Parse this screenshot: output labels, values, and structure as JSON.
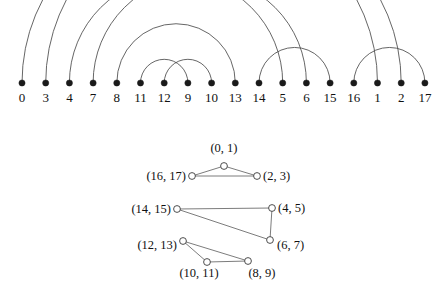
{
  "figure": {
    "title": "",
    "colors": {
      "arc_stroke": "#4a4a4a",
      "node_fill": "#1a1a1a",
      "edge_stroke": "#5a5a5a",
      "open_node_fill": "#ffffff",
      "open_node_stroke": "#3a3a3a",
      "background": "#ffffff",
      "text": "#111111"
    }
  },
  "chart_data": {
    "type": "diagram",
    "title": "",
    "xlabel": "",
    "ylabel": "",
    "subplots": [
      {
        "name": "arc-diagram",
        "type": "arc",
        "node_order": [
          "0",
          "3",
          "4",
          "7",
          "8",
          "11",
          "12",
          "9",
          "10",
          "13",
          "14",
          "5",
          "6",
          "15",
          "16",
          "1",
          "2",
          "17"
        ],
        "node_positions_x": [
          22,
          45.7,
          69.4,
          93.1,
          116.8,
          140.5,
          164.2,
          187.9,
          211.6,
          235.3,
          259,
          282.7,
          306.4,
          330.1,
          353.8,
          377.5,
          401.2,
          424.9
        ],
        "baseline_y": 83,
        "arcs": [
          {
            "from_index": 0,
            "to_index": 15,
            "from_label": "0",
            "to_label": "1"
          },
          {
            "from_index": 1,
            "to_index": 16,
            "from_label": "3",
            "to_label": "2"
          },
          {
            "from_index": 2,
            "to_index": 11,
            "from_label": "4",
            "to_label": "5"
          },
          {
            "from_index": 3,
            "to_index": 12,
            "from_label": "7",
            "to_label": "6"
          },
          {
            "from_index": 4,
            "to_index": 9,
            "from_label": "8",
            "to_label": "13"
          },
          {
            "from_index": 5,
            "to_index": 7,
            "from_label": "11",
            "to_label": "9"
          },
          {
            "from_index": 6,
            "to_index": 8,
            "from_label": "12",
            "to_label": "10"
          },
          {
            "from_index": 10,
            "to_index": 13,
            "from_label": "14",
            "to_label": "15"
          },
          {
            "from_index": 14,
            "to_index": 17,
            "from_label": "16",
            "to_label": "17"
          }
        ]
      },
      {
        "name": "pair-graph",
        "type": "graph",
        "nodes": [
          {
            "id": "0_1",
            "label": "(0, 1)",
            "x": 224,
            "y": 166,
            "label_x": 224,
            "label_y": 152,
            "label_anchor": "middle"
          },
          {
            "id": "16_17",
            "label": "(16, 17)",
            "x": 192,
            "y": 176,
            "label_x": 186,
            "label_y": 180,
            "label_anchor": "end"
          },
          {
            "id": "2_3",
            "label": "(2, 3)",
            "x": 257,
            "y": 176,
            "label_x": 263,
            "label_y": 180,
            "label_anchor": "start"
          },
          {
            "id": "14_15",
            "label": "(14, 15)",
            "x": 177,
            "y": 209,
            "label_x": 171,
            "label_y": 213,
            "label_anchor": "end"
          },
          {
            "id": "4_5",
            "label": "(4, 5)",
            "x": 272,
            "y": 208,
            "label_x": 278,
            "label_y": 212,
            "label_anchor": "start"
          },
          {
            "id": "6_7",
            "label": "(6, 7)",
            "x": 270,
            "y": 240,
            "label_x": 277,
            "label_y": 249,
            "label_anchor": "start"
          },
          {
            "id": "12_13",
            "label": "(12, 13)",
            "x": 183,
            "y": 241,
            "label_x": 177,
            "label_y": 249,
            "label_anchor": "end"
          },
          {
            "id": "10_11",
            "label": "(10, 11)",
            "x": 207,
            "y": 262,
            "label_x": 199,
            "label_y": 277,
            "label_anchor": "middle"
          },
          {
            "id": "8_9",
            "label": "(8, 9)",
            "x": 248,
            "y": 261,
            "label_x": 262,
            "label_y": 277,
            "label_anchor": "middle"
          }
        ],
        "edges": [
          {
            "from": "16_17",
            "to": "0_1"
          },
          {
            "from": "0_1",
            "to": "2_3"
          },
          {
            "from": "16_17",
            "to": "2_3"
          },
          {
            "from": "14_15",
            "to": "4_5"
          },
          {
            "from": "14_15",
            "to": "6_7"
          },
          {
            "from": "4_5",
            "to": "6_7"
          },
          {
            "from": "12_13",
            "to": "10_11"
          },
          {
            "from": "12_13",
            "to": "8_9"
          },
          {
            "from": "10_11",
            "to": "8_9"
          }
        ]
      }
    ]
  }
}
